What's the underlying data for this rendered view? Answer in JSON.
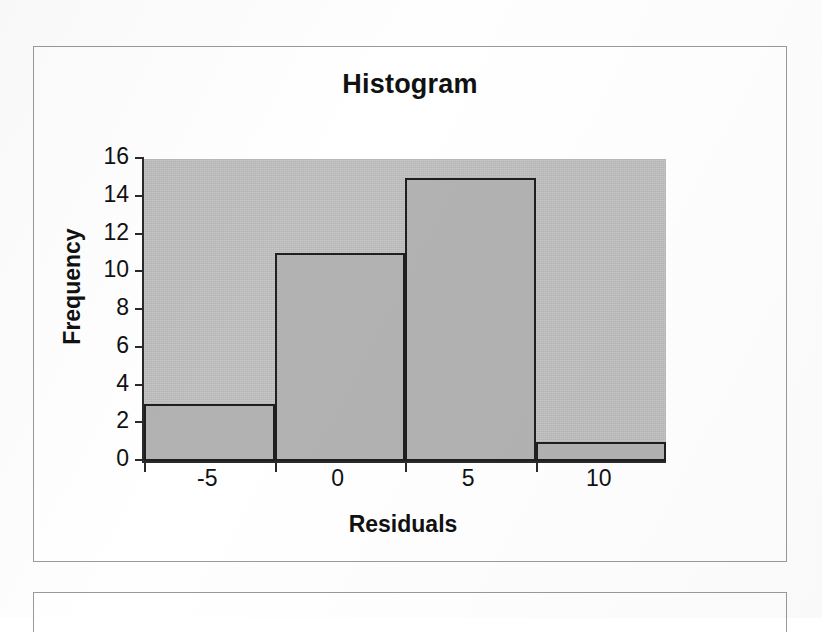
{
  "figure": {
    "title": "Histogram",
    "x_axis_title": "Residuals",
    "y_axis_title": "Frequency"
  },
  "chart_data": {
    "type": "bar",
    "title": "Histogram",
    "xlabel": "Residuals",
    "ylabel": "Frequency",
    "categories": [
      "-5",
      "0",
      "5",
      "10"
    ],
    "values": [
      3,
      11,
      15,
      1
    ],
    "ylim": [
      0,
      16
    ],
    "y_ticks": [
      0,
      2,
      4,
      6,
      8,
      10,
      12,
      14,
      16
    ],
    "y_tick_labels": [
      "0",
      "2",
      "4",
      "6",
      "8",
      "10",
      "12",
      "14",
      "16"
    ],
    "x_tick_labels": [
      "-5",
      "0",
      "5",
      "10"
    ],
    "grid": false,
    "legend": false,
    "bar_fill": "#b2b2b2",
    "bar_edge": "#1f1f1f",
    "plot_background": "#b9b9b9"
  },
  "y_axis": {
    "ticks": [
      {
        "label": "16",
        "value": 16
      },
      {
        "label": "14",
        "value": 14
      },
      {
        "label": "12",
        "value": 12
      },
      {
        "label": "10",
        "value": 10
      },
      {
        "label": "8",
        "value": 8
      },
      {
        "label": "6",
        "value": 6
      },
      {
        "label": "4",
        "value": 4
      },
      {
        "label": "2",
        "value": 2
      },
      {
        "label": "0",
        "value": 0
      }
    ]
  },
  "x_axis": {
    "ticks": [
      {
        "label": "-5"
      },
      {
        "label": "0"
      },
      {
        "label": "5"
      },
      {
        "label": "10"
      }
    ]
  }
}
